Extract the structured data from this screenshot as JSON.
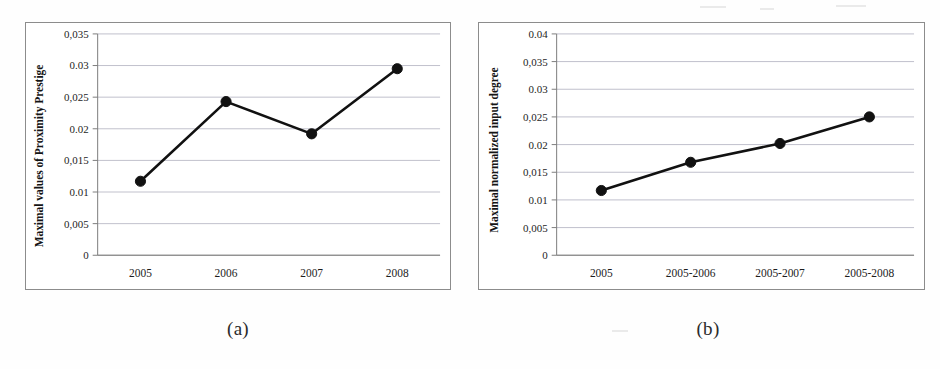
{
  "figure": {
    "caption_a": "(a)",
    "caption_b": "(b)"
  },
  "panels": [
    {
      "id": "a",
      "caption": "(a)",
      "ylabel": "Maximal values of Proximity Prestige",
      "ytick_labels": [
        "0,035",
        "0.03",
        "0,025",
        "0.02",
        "0,015",
        "0.01",
        "0,005",
        "0"
      ],
      "xtick_labels": [
        "2005",
        "2006",
        "2007",
        "2008"
      ]
    },
    {
      "id": "b",
      "caption": "(b)",
      "ylabel": "Maximal normalized input degree",
      "ytick_labels": [
        "0.04",
        "0,035",
        "0.03",
        "0,025",
        "0.02",
        "0,015",
        "0.01",
        "0,005",
        "0"
      ],
      "xtick_labels": [
        "2005",
        "2005-2006",
        "2005-2007",
        "2005-2008"
      ]
    }
  ],
  "chart_data": [
    {
      "type": "line",
      "title": "",
      "subtitle": "",
      "xlabel": "",
      "ylabel": "Maximal values of Proximity Prestige",
      "categories": [
        "2005",
        "2006",
        "2007",
        "2008"
      ],
      "values": [
        0.0117,
        0.0243,
        0.0192,
        0.0295
      ],
      "ylim": [
        0,
        0.035
      ],
      "ytick_values": [
        0,
        0.005,
        0.01,
        0.015,
        0.02,
        0.025,
        0.03,
        0.035
      ],
      "ytick_labels": [
        "0",
        "0,005",
        "0.01",
        "0,015",
        "0.02",
        "0,025",
        "0.03",
        "0,035"
      ],
      "grid": true,
      "grid_axis": "y",
      "legend": false,
      "marker": "circle",
      "series_color": "#111111",
      "grid_color": "#b9b9c6",
      "annotation": "(a)"
    },
    {
      "type": "line",
      "title": "",
      "subtitle": "",
      "xlabel": "",
      "ylabel": "Maximal normalized input degree",
      "categories": [
        "2005",
        "2005-2006",
        "2005-2007",
        "2005-2008"
      ],
      "values": [
        0.0117,
        0.0168,
        0.0202,
        0.025
      ],
      "ylim": [
        0,
        0.04
      ],
      "ytick_values": [
        0,
        0.005,
        0.01,
        0.015,
        0.02,
        0.025,
        0.03,
        0.035,
        0.04
      ],
      "ytick_labels": [
        "0",
        "0,005",
        "0.01",
        "0,015",
        "0.02",
        "0,025",
        "0.03",
        "0,035",
        "0.04"
      ],
      "grid": true,
      "grid_axis": "y",
      "legend": false,
      "marker": "circle",
      "series_color": "#111111",
      "grid_color": "#b9b9c6",
      "annotation": "(b)"
    }
  ]
}
